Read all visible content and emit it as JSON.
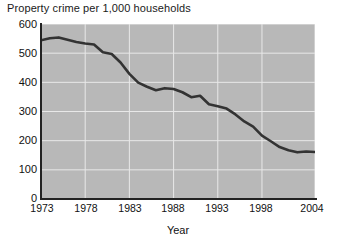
{
  "chart_data": {
    "type": "line",
    "title": "Property crime per 1,000 households",
    "xlabel": "Year",
    "ylabel": "",
    "xlim": [
      1973,
      2004
    ],
    "ylim": [
      0,
      600
    ],
    "ytick_labels": [
      "600",
      "500",
      "400",
      "300",
      "200",
      "100",
      "0"
    ],
    "yticks": [
      600,
      500,
      400,
      300,
      200,
      100,
      0
    ],
    "xtick_labels": [
      "1973",
      "1978",
      "1983",
      "1988",
      "1993",
      "1998",
      "2004"
    ],
    "xticks": [
      1973,
      1978,
      1983,
      1988,
      1993,
      1998,
      2004
    ],
    "grid": true,
    "legend": false,
    "plot_background": "#b8b8b8",
    "grid_color": "#e8e8e8",
    "line_color": "#333333",
    "x": [
      1973,
      1974,
      1975,
      1976,
      1977,
      1978,
      1979,
      1980,
      1981,
      1982,
      1983,
      1984,
      1985,
      1986,
      1987,
      1988,
      1989,
      1990,
      1991,
      1992,
      1993,
      1994,
      1995,
      1996,
      1997,
      1998,
      1999,
      2000,
      2001,
      2002,
      2003,
      2004
    ],
    "values": [
      544,
      551,
      554,
      546,
      538,
      533,
      530,
      503,
      497,
      468,
      429,
      399,
      385,
      373,
      380,
      377,
      366,
      349,
      354,
      325,
      318,
      310,
      290,
      266,
      248,
      217,
      198,
      178,
      167,
      160,
      163,
      161
    ],
    "series": [
      {
        "name": "Property crime rate",
        "values": [
          544,
          551,
          554,
          546,
          538,
          533,
          530,
          503,
          497,
          468,
          429,
          399,
          385,
          373,
          380,
          377,
          366,
          349,
          354,
          325,
          318,
          310,
          290,
          266,
          248,
          217,
          198,
          178,
          167,
          160,
          163,
          161
        ]
      }
    ]
  }
}
